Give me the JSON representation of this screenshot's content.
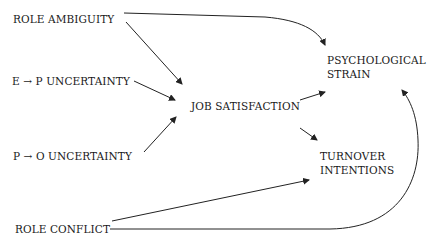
{
  "diagram": {
    "type": "path-model",
    "nodes": {
      "role_ambiguity": "ROLE AMBIGUITY",
      "ep_uncertainty": "E → P  UNCERTAINTY",
      "po_uncertainty": "P → O UNCERTAINTY",
      "role_conflict": "ROLE CONFLICT",
      "job_satisfaction": "JOB SATISFACTION",
      "psych_strain_line1": "PSYCHOLOGICAL",
      "psych_strain_line2": "STRAIN",
      "turnover_line1": "TURNOVER",
      "turnover_line2": "INTENTIONS"
    },
    "edges": [
      {
        "from": "ROLE AMBIGUITY",
        "to": "PSYCHOLOGICAL STRAIN"
      },
      {
        "from": "ROLE AMBIGUITY",
        "to": "JOB SATISFACTION"
      },
      {
        "from": "E → P UNCERTAINTY",
        "to": "JOB SATISFACTION"
      },
      {
        "from": "P → O UNCERTAINTY",
        "to": "JOB SATISFACTION"
      },
      {
        "from": "JOB SATISFACTION",
        "to": "PSYCHOLOGICAL STRAIN"
      },
      {
        "from": "JOB SATISFACTION",
        "to": "TURNOVER INTENTIONS"
      },
      {
        "from": "ROLE CONFLICT",
        "to": "TURNOVER INTENTIONS"
      },
      {
        "from": "ROLE CONFLICT",
        "to": "PSYCHOLOGICAL STRAIN"
      }
    ]
  }
}
